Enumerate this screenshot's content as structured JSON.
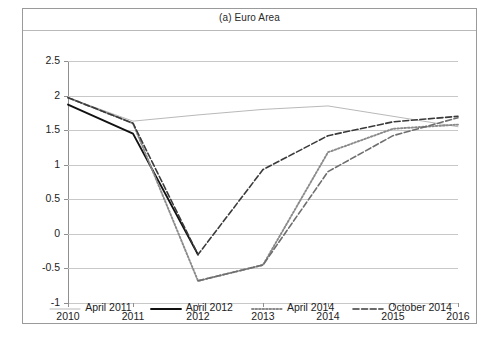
{
  "figure": {
    "title": "(a) Euro Area"
  },
  "axes": {
    "y_ticks": [
      "2.5",
      "2",
      "1.5",
      "1",
      "0.5",
      "0",
      "-0.5",
      "-1"
    ],
    "x_ticks": [
      "2010",
      "2011",
      "2012",
      "2013",
      "2014",
      "2015",
      "2016"
    ]
  },
  "legend": {
    "items": [
      {
        "label": "April 2011",
        "style": "solid-thin",
        "color": "#b0b0b0"
      },
      {
        "label": "April 2012",
        "style": "solid-thick",
        "color": "#111111"
      },
      {
        "label": "April 2014",
        "style": "dotted",
        "color": "#8a8a8a"
      },
      {
        "label": "October 2014",
        "style": "dash-dot",
        "color": "#3a3a3a"
      }
    ]
  },
  "chart_data": {
    "type": "line",
    "title": "(a) Euro Area",
    "xlabel": "",
    "ylabel": "",
    "x": [
      2010,
      2011,
      2012,
      2013,
      2014,
      2015,
      2016
    ],
    "xlim": [
      2010,
      2016
    ],
    "ylim": [
      -1,
      2.5
    ],
    "ytick_step": 0.5,
    "grid": true,
    "legend_position": "bottom",
    "series": [
      {
        "name": "April 2011",
        "color": "#b0b0b0",
        "style": "solid-thin",
        "x": [
          2010,
          2011,
          2012,
          2013,
          2014,
          2015,
          2016
        ],
        "values": [
          1.97,
          1.63,
          1.72,
          1.8,
          1.85,
          1.7,
          1.55
        ]
      },
      {
        "name": "April 2012",
        "color": "#111111",
        "style": "solid-thick",
        "x": [
          2010,
          2011,
          2012
        ],
        "values": [
          1.87,
          1.45,
          -0.3
        ]
      },
      {
        "name": "April 2014",
        "color": "#8a8a8a",
        "style": "dotted",
        "x": [
          2010,
          2011,
          2012,
          2013,
          2014,
          2015,
          2016
        ],
        "values": [
          1.97,
          1.6,
          -0.68,
          -0.45,
          1.18,
          1.52,
          1.58
        ]
      },
      {
        "name": "October 2014",
        "color": "#3a3a3a",
        "style": "dash-dot",
        "x": [
          2010,
          2011,
          2012,
          2013,
          2014,
          2015,
          2016
        ],
        "values": [
          1.97,
          1.6,
          -0.3,
          0.93,
          1.42,
          1.62,
          1.7
        ]
      },
      {
        "name": "October 2014 lower",
        "color": "#6e6e6e",
        "style": "dash-dot",
        "x": [
          2012,
          2013,
          2014,
          2015,
          2016
        ],
        "values": [
          -0.68,
          -0.45,
          0.9,
          1.42,
          1.68
        ]
      }
    ]
  }
}
